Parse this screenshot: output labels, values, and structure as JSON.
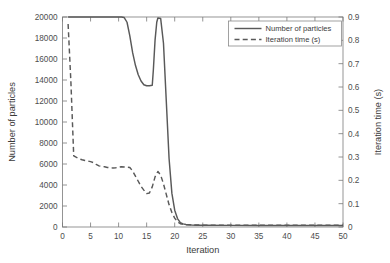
{
  "chart_data": {
    "type": "line",
    "title": "",
    "xlabel": "Iteration",
    "ylabel": "Number of particles",
    "y2label": "Iteration time (s)",
    "xlim": [
      0,
      50
    ],
    "ylim": [
      0,
      20000
    ],
    "y2lim": [
      0,
      0.9
    ],
    "grid": false,
    "legend_position": "top-right",
    "xticks": [
      0,
      5,
      10,
      15,
      20,
      25,
      30,
      35,
      40,
      45,
      50
    ],
    "xticklabels": [
      "0",
      "5",
      "10",
      "15",
      "20",
      "25",
      "30",
      "35",
      "40",
      "45",
      "50"
    ],
    "yticks": [
      0,
      2000,
      4000,
      6000,
      8000,
      10000,
      12000,
      14000,
      16000,
      18000,
      20000
    ],
    "yticklabels": [
      "0",
      "2000",
      "4000",
      "6000",
      "8000",
      "10000",
      "12000",
      "14000",
      "16000",
      "18000",
      "20000"
    ],
    "y2ticks": [
      0,
      0.1,
      0.2,
      0.3,
      0.4,
      0.5,
      0.6,
      0.7,
      0.8,
      0.9
    ],
    "y2ticklabels": [
      "0",
      "0.1",
      "0.2",
      "0.3",
      "0.4",
      "0.5",
      "0.6",
      "0.7",
      "0.8",
      "0.9"
    ],
    "line_color": "#595959",
    "background_color": "#ffffff",
    "series": [
      {
        "name": "Number of particles",
        "axis": "left",
        "style": "solid",
        "color": "#595959",
        "x": [
          1,
          2,
          3,
          4,
          5,
          6,
          7,
          8,
          9,
          10,
          10.5,
          11,
          11.5,
          12,
          12.5,
          13,
          13.5,
          14,
          14.5,
          15,
          15.5,
          16,
          16.2,
          16.5,
          16.8,
          17,
          17.5,
          18,
          18.5,
          19,
          19.5,
          20,
          20.5,
          21,
          21.5,
          22,
          23,
          24,
          25,
          30,
          35,
          40,
          45,
          50
        ],
        "y": [
          20000,
          20000,
          20000,
          20000,
          20000,
          20000,
          20000,
          20000,
          20000,
          20000,
          20000,
          19950,
          19500,
          18200,
          16600,
          15400,
          14500,
          13900,
          13550,
          13450,
          13450,
          13500,
          15000,
          17800,
          19500,
          19900,
          19850,
          17500,
          12000,
          6500,
          3200,
          1600,
          800,
          420,
          300,
          240,
          190,
          175,
          165,
          155,
          150,
          150,
          150,
          150
        ]
      },
      {
        "name": "Iteration time (s)",
        "axis": "right",
        "style": "dashed",
        "color": "#595959",
        "x": [
          1,
          1.5,
          2,
          2.5,
          3,
          3.5,
          4,
          4.5,
          5,
          5.5,
          6,
          6.5,
          7,
          7.5,
          8,
          8.5,
          9,
          9.5,
          10,
          10.5,
          11,
          11.5,
          12,
          12.5,
          13,
          13.5,
          14,
          14.5,
          15,
          15.5,
          16,
          16.5,
          17,
          17.5,
          18,
          18.5,
          19,
          19.5,
          20,
          20.5,
          21,
          22,
          23,
          25,
          30,
          35,
          40,
          45,
          50
        ],
        "y": [
          0.87,
          0.62,
          0.305,
          0.298,
          0.292,
          0.288,
          0.285,
          0.283,
          0.28,
          0.276,
          0.268,
          0.262,
          0.26,
          0.258,
          0.255,
          0.254,
          0.253,
          0.254,
          0.256,
          0.258,
          0.257,
          0.256,
          0.255,
          0.24,
          0.218,
          0.196,
          0.174,
          0.158,
          0.143,
          0.146,
          0.172,
          0.215,
          0.238,
          0.222,
          0.185,
          0.14,
          0.095,
          0.062,
          0.038,
          0.022,
          0.014,
          0.01,
          0.009,
          0.008,
          0.008,
          0.008,
          0.008,
          0.008,
          0.008
        ]
      }
    ]
  },
  "legend": {
    "items": [
      {
        "label": "Number of particles",
        "style": "solid"
      },
      {
        "label": "Iteration time (s)",
        "style": "dashed"
      }
    ]
  }
}
